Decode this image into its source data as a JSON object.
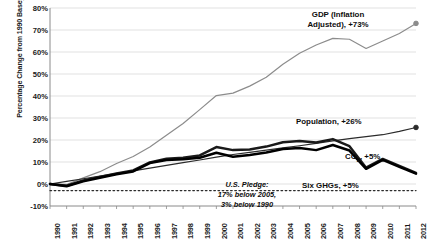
{
  "chart_data": {
    "type": "line",
    "title": "",
    "xlabel": "",
    "ylabel": "Percentage Change from 1990 Baseyear",
    "x": [
      1990,
      1991,
      1992,
      1993,
      1994,
      1995,
      1996,
      1997,
      1998,
      1999,
      2000,
      2001,
      2002,
      2003,
      2004,
      2005,
      2006,
      2007,
      2008,
      2009,
      2010,
      2011,
      2012
    ],
    "ylim": [
      -10,
      80
    ],
    "yticks": [
      "-10%",
      "0%",
      "10%",
      "20%",
      "30%",
      "40%",
      "50%",
      "60%",
      "70%",
      "80%"
    ],
    "ytick_values": [
      -10,
      0,
      10,
      20,
      30,
      40,
      50,
      60,
      70,
      80
    ],
    "xtick_labels": [
      "1990",
      "1991",
      "1992",
      "1993",
      "1994",
      "1995",
      "1996",
      "1997",
      "1998",
      "1999",
      "2000",
      "2001",
      "2002",
      "2003",
      "2004",
      "2005",
      "2006",
      "2007",
      "2008",
      "2009",
      "2010",
      "2011",
      "2012"
    ],
    "grid": true,
    "legend_position": "inline-annotations",
    "series": [
      {
        "name": "GDP (Inflation Adjusted)",
        "color": "#8c8c8c",
        "end_label": "GDP (Inflation Adjusted), +73%",
        "end_value": 73,
        "values": [
          0,
          -0.2,
          2.8,
          5.6,
          9.3,
          12.5,
          16.8,
          22.2,
          27.5,
          33.8,
          40.2,
          41.3,
          44.5,
          48.5,
          54.4,
          59.4,
          63.2,
          66.2,
          65.8,
          61.6,
          65.0,
          68.4,
          73.0
        ]
      },
      {
        "name": "Population",
        "color": "#2b2b2b",
        "end_label": "Population, +26%",
        "end_value": 26,
        "values": [
          0,
          1.2,
          2.4,
          3.6,
          4.8,
          6.0,
          7.2,
          8.5,
          9.7,
          10.9,
          12.2,
          13.4,
          14.4,
          15.4,
          16.4,
          17.4,
          18.5,
          19.6,
          20.6,
          21.5,
          22.4,
          23.9,
          25.7
        ]
      },
      {
        "name": "CO2",
        "color": "#1a1a1a",
        "end_label": "CO₂, +5%",
        "end_value": 5,
        "values": [
          0,
          -0.8,
          1.6,
          3.2,
          4.8,
          6.2,
          9.8,
          11.5,
          11.9,
          13.0,
          16.8,
          15.4,
          15.7,
          17.0,
          19.0,
          19.5,
          18.9,
          20.4,
          17.2,
          7.4,
          11.4,
          8.2,
          5.0
        ]
      },
      {
        "name": "Six GHGs",
        "color": "#000000",
        "end_label": "Six GHGs, +5%",
        "end_value": 5,
        "values": [
          0,
          -1.0,
          1.2,
          2.8,
          4.4,
          5.7,
          9.5,
          10.9,
          11.3,
          11.9,
          14.2,
          12.4,
          13.2,
          14.3,
          15.9,
          16.4,
          15.4,
          17.7,
          15.2,
          6.9,
          11.0,
          7.8,
          4.7
        ]
      }
    ],
    "reference_line": {
      "name": "U.S. Pledge",
      "value": -3,
      "style": "dotted",
      "label_line1": "U.S. Pledge:",
      "label_line2": "17% below 2005,",
      "label_line3": "3% below 1990"
    }
  }
}
